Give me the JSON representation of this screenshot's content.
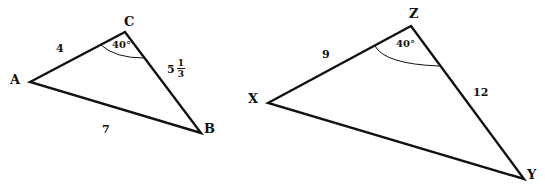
{
  "triangles": [
    {
      "name": "ABC",
      "vertices": {
        "A": "A",
        "B": "B",
        "C": "C"
      },
      "sides": {
        "AC": "4",
        "CB_whole": "5",
        "CB_num": "1",
        "CB_den": "3",
        "AB": "7"
      },
      "angle_C": "40°"
    },
    {
      "name": "XYZ",
      "vertices": {
        "X": "X",
        "Y": "Y",
        "Z": "Z"
      },
      "sides": {
        "XZ": "9",
        "ZY": "12"
      },
      "angle_Z": "40°"
    }
  ]
}
